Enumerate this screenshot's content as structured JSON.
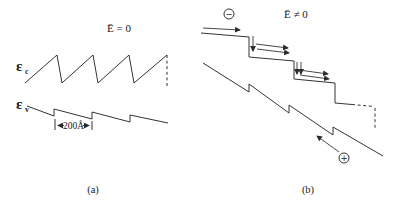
{
  "colors": {
    "background": "#ffffff",
    "line": "#333333",
    "text": "#1a1a1a"
  },
  "panel_a": {
    "title": "Ē = 0",
    "conduction_band": {
      "symbol": "ε",
      "subscript": "c"
    },
    "valence_band": {
      "symbol": "ε",
      "subscript": "v"
    },
    "period_annotation": "200Å",
    "caption": "(a)"
  },
  "panel_b": {
    "title": "Ē ≠ 0",
    "electron_symbol": "−",
    "hole_symbol": "+",
    "caption": "(b)"
  }
}
